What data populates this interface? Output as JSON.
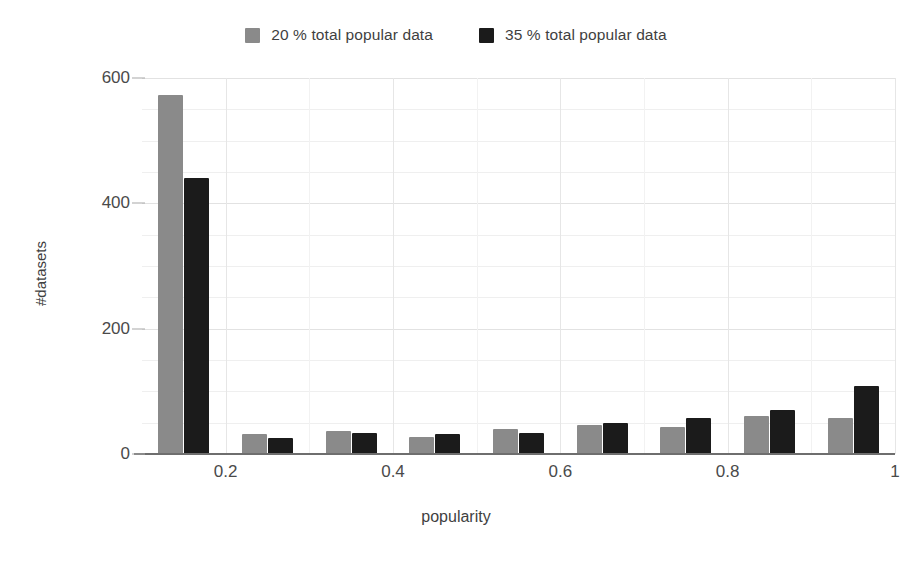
{
  "chart_data": {
    "type": "bar",
    "title": "",
    "subtitle": "",
    "xlabel": "popularity",
    "ylabel": "#datasets",
    "xlim": [
      0.1,
      1.0
    ],
    "ylim": [
      0,
      600
    ],
    "grid": true,
    "legend_position": "top-center",
    "x": [
      0.15,
      0.25,
      0.35,
      0.45,
      0.55,
      0.65,
      0.75,
      0.85,
      0.95
    ],
    "categories": [
      "0.15",
      "0.25",
      "0.35",
      "0.45",
      "0.55",
      "0.65",
      "0.75",
      "0.85",
      "0.95"
    ],
    "series": [
      {
        "name": "20 % total popular data",
        "color": "#8a8a8a",
        "values": [
          573,
          32,
          36,
          27,
          40,
          46,
          43,
          61,
          57
        ]
      },
      {
        "name": "35 % total popular data",
        "color": "#1b1b1b",
        "values": [
          440,
          26,
          34,
          32,
          34,
          49,
          57,
          70,
          108
        ]
      }
    ],
    "xticks": [
      {
        "value": 0.2,
        "label": "0.2"
      },
      {
        "value": 0.4,
        "label": "0.4"
      },
      {
        "value": 0.6,
        "label": "0.6"
      },
      {
        "value": 0.8,
        "label": "0.8"
      },
      {
        "value": 1.0,
        "label": "1"
      }
    ],
    "yticks": [
      {
        "value": 0,
        "label": "0"
      },
      {
        "value": 200,
        "label": "200"
      },
      {
        "value": 400,
        "label": "400"
      },
      {
        "value": 600,
        "label": "600"
      }
    ],
    "yminor": [
      50,
      100,
      150,
      250,
      300,
      350,
      450,
      500,
      550
    ],
    "xminor": [
      0.3,
      0.5,
      0.7,
      0.9
    ]
  },
  "legend": {
    "entries": [
      {
        "label": "20 % total popular data",
        "color": "#8a8a8a",
        "swatch_name": "legend-swatch-series-1"
      },
      {
        "label": "35 % total popular data",
        "color": "#1b1b1b",
        "swatch_name": "legend-swatch-series-2"
      }
    ]
  },
  "colors": {
    "series_1": "#8a8a8a",
    "series_2": "#1b1b1b",
    "axis": "#6e6e6e",
    "grid_major": "#e2e2e2",
    "grid_minor": "#f2f2f2",
    "text": "#3f3f3f",
    "background": "#ffffff"
  }
}
